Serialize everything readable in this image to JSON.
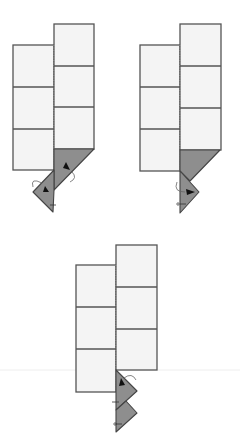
{
  "colors": {
    "panel": "#f4f4f4",
    "outline": "#555555",
    "flap": "#8e8e8e"
  },
  "steps": [
    {
      "id": "step-1",
      "label": "Fold the bottom corner down and tuck (two flaps rotated)"
    },
    {
      "id": "step-2",
      "label": "Fold the small triangle flap to the right"
    },
    {
      "id": "step-3",
      "label": "Two triangular flaps pointing right"
    }
  ]
}
